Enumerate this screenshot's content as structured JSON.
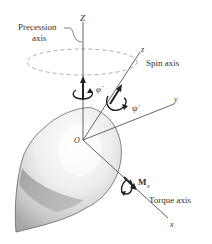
{
  "diagram": {
    "type": "gyroscope-top-precession",
    "labels": {
      "Z_axis": "Z",
      "precession_axis_line1": "Precession",
      "precession_axis_line2": "axis",
      "spin_z": "z",
      "spin_axis": "Spin axis",
      "phi_dot": "φ̇",
      "psi_dot": "ψ̇",
      "y_axis": "y",
      "origin": "O",
      "moment": "M",
      "moment_sub": "x",
      "torque_axis": "Torque axis",
      "x_axis": "x"
    },
    "colors": {
      "line": "#555555",
      "text": "#333333",
      "dashed_ellipse": "#999999",
      "body_light": "#f2f2f2",
      "body_mid": "#cfcfcf",
      "body_dark": "#9a9a9a"
    }
  }
}
